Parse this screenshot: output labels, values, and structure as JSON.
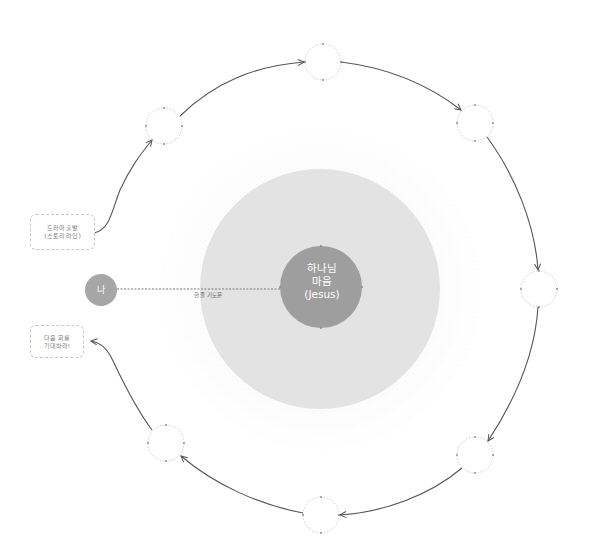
{
  "diagram": {
    "center": {
      "line1": "하나님",
      "line2": "마음",
      "line3": "(Jesus)",
      "color": "#9e9e9e"
    },
    "outer_zone_color": "#e3e3e3",
    "me": {
      "label": "나",
      "color": "#a6a6a6"
    },
    "connector_label": "한 줄 기도문",
    "start_box": {
      "line1": "드라마 출발",
      "line2": "(스토리 라인)"
    },
    "end_box": {
      "line1": "다음 회를",
      "line2": "기대하라!"
    },
    "cycle_nodes": [
      {
        "id": "top-left",
        "label": ""
      },
      {
        "id": "top",
        "label": ""
      },
      {
        "id": "top-right",
        "label": ""
      },
      {
        "id": "right",
        "label": ""
      },
      {
        "id": "bottom-right",
        "label": ""
      },
      {
        "id": "bottom",
        "label": ""
      },
      {
        "id": "bottom-left",
        "label": ""
      }
    ],
    "stroke_color": "#555555",
    "node_border_color": "#c4c4c4"
  }
}
